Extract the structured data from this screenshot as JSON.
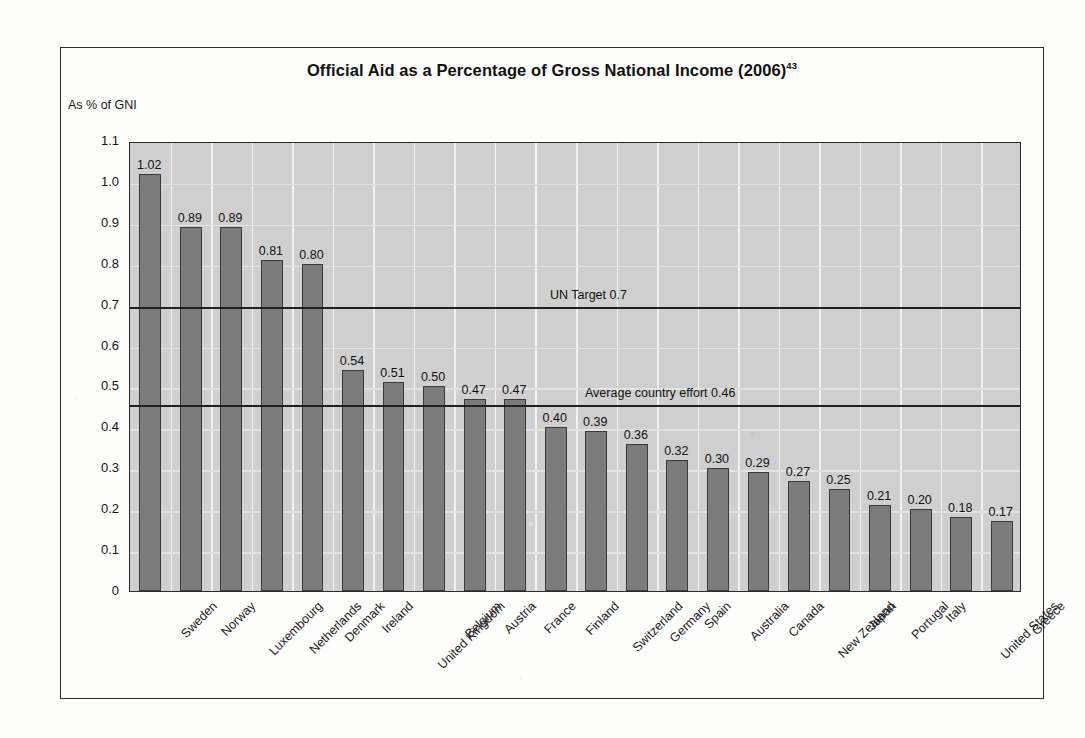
{
  "figure": {
    "title": "Official Aid as a Percentage of Gross National Income (2006)",
    "title_superscript": "43",
    "y_axis_title": "As % of GNI"
  },
  "chart_data": {
    "type": "bar",
    "title": "Official Aid as a Percentage of Gross National Income (2006)",
    "xlabel": "",
    "ylabel": "As % of GNI",
    "ylim": [
      0,
      1.1
    ],
    "grid": true,
    "legend": "none",
    "categories": [
      "Sweden",
      "Norway",
      "Luxembourg",
      "Netherlands",
      "Denmark",
      "Ireland",
      "United Kingdom",
      "Belgium",
      "Austria",
      "France",
      "Finland",
      "Switzerland",
      "Germany",
      "Spain",
      "Australia",
      "Canada",
      "New Zealand",
      "Japan",
      "Portugal",
      "Italy",
      "United States",
      "Greece"
    ],
    "values": [
      1.02,
      0.89,
      0.89,
      0.81,
      0.8,
      0.54,
      0.51,
      0.5,
      0.47,
      0.47,
      0.4,
      0.39,
      0.36,
      0.32,
      0.3,
      0.29,
      0.27,
      0.25,
      0.21,
      0.2,
      0.18,
      0.17
    ],
    "value_labels": [
      "1.02",
      "0.89",
      "0.89",
      "0.81",
      "0.80",
      "0.54",
      "0.51",
      "0.50",
      "0.47",
      "0.47",
      "0.40",
      "0.39",
      "0.36",
      "0.32",
      "0.30",
      "0.29",
      "0.27",
      "0.25",
      "0.21",
      "0.20",
      "0.18",
      "0.17"
    ],
    "ytick_labels": [
      "1.1",
      "1.0",
      "0.9",
      "0.8",
      "0.7",
      "0.6",
      "0.5",
      "0.4",
      "0.3",
      "0.2",
      "0.1",
      "0"
    ],
    "ytick_values": [
      1.1,
      1.0,
      0.9,
      0.8,
      0.7,
      0.6,
      0.5,
      0.4,
      0.3,
      0.2,
      0.1,
      0
    ],
    "reference_lines": [
      {
        "label": "UN Target 0.7",
        "value": 0.7
      },
      {
        "label": "Average country effort 0.46",
        "value": 0.46
      }
    ],
    "colors": {
      "bar_fill": "#7c7c7c",
      "bar_border": "#3a3a3a",
      "plot_background": "#cfcfcf",
      "gridline": "#f2f2f2",
      "reference_line": "#1f1f1f",
      "frame": "#2e2e2e"
    }
  }
}
